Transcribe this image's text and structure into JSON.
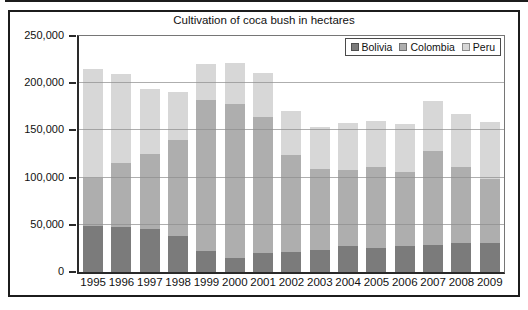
{
  "title": "Cultivation of coca bush in hectares",
  "y_axis": {
    "tick_labels": [
      "250,000",
      "200,000",
      "150,000",
      "100,000",
      "50,000",
      "0"
    ]
  },
  "chart_data": {
    "type": "bar",
    "stacked": true,
    "title": "Cultivation of coca bush in hectares",
    "unit": "hectares",
    "categories": [
      "1995",
      "1996",
      "1997",
      "1998",
      "1999",
      "2000",
      "2001",
      "2002",
      "2003",
      "2004",
      "2005",
      "2006",
      "2007",
      "2008",
      "2009"
    ],
    "series": [
      {
        "name": "Bolivia",
        "color": "#7b7b7b",
        "values": [
          48600,
          48100,
          45800,
          38000,
          21800,
          14600,
          19900,
          21600,
          23600,
          27700,
          25400,
          27500,
          28900,
          30500,
          30900
        ]
      },
      {
        "name": "Colombia",
        "color": "#aeaeae",
        "values": [
          50900,
          67200,
          79400,
          101800,
          160100,
          163300,
          144800,
          102000,
          86000,
          80000,
          86000,
          78000,
          99000,
          81000,
          68000
        ]
      },
      {
        "name": "Peru",
        "color": "#d7d7d7",
        "values": [
          115300,
          94400,
          68800,
          51000,
          38700,
          43400,
          46200,
          46700,
          44200,
          50300,
          48200,
          51400,
          53700,
          56100,
          59900
        ]
      }
    ],
    "ylim": [
      0,
      250000
    ],
    "y_tick_interval": 50000,
    "grid": true,
    "legend_position": "top-right"
  }
}
